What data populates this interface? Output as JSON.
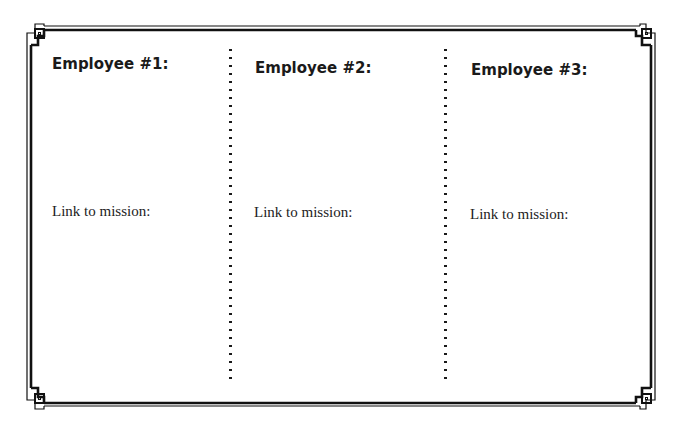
{
  "document": {
    "columns": [
      {
        "title": "Employee #1:",
        "label": "Link to mission:"
      },
      {
        "title": "Employee #2:",
        "label": "Link to mission:"
      },
      {
        "title": "Employee #3:",
        "label": "Link to mission:"
      }
    ]
  },
  "style": {
    "border_color": "#111111",
    "background": "#ffffff"
  }
}
